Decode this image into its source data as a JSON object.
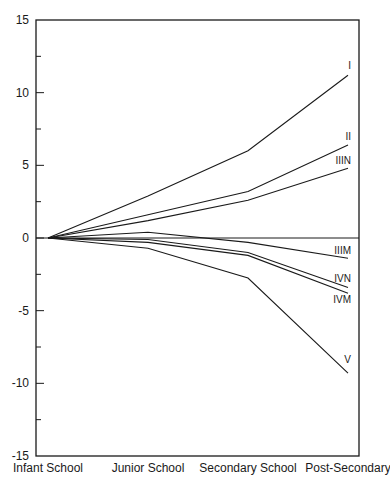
{
  "chart_data": {
    "type": "line",
    "title": "",
    "xlabel": "",
    "ylabel": "",
    "categories": [
      "Infant School",
      "Junior School",
      "Secondary School",
      "Post-Secondary"
    ],
    "ylim": [
      -15,
      15
    ],
    "yticks_major": [
      15,
      10,
      5,
      0,
      -5,
      -10,
      -15
    ],
    "yticks_minor": [
      12.5,
      7.5,
      2.5,
      -2.5,
      -7.5,
      -12.5
    ],
    "grid": false,
    "legend": "inline labels at line ends",
    "reference_line": 0,
    "series": [
      {
        "name": "I",
        "values": [
          0,
          2.9,
          6.0,
          11.2
        ]
      },
      {
        "name": "II",
        "values": [
          0,
          1.6,
          3.2,
          6.4
        ]
      },
      {
        "name": "IIIN",
        "values": [
          0,
          1.2,
          2.6,
          4.8
        ]
      },
      {
        "name": "IIIM",
        "values": [
          0,
          0.4,
          -0.3,
          -1.4
        ]
      },
      {
        "name": "IVN",
        "values": [
          0,
          -0.1,
          -1.0,
          -3.4
        ]
      },
      {
        "name": "IVM",
        "values": [
          0,
          -0.3,
          -1.2,
          -3.8
        ]
      },
      {
        "name": "V",
        "values": [
          0,
          -0.7,
          -2.75,
          -9.3
        ]
      }
    ]
  },
  "colors": {
    "line": "#1a1a1a",
    "background": "#ffffff"
  }
}
